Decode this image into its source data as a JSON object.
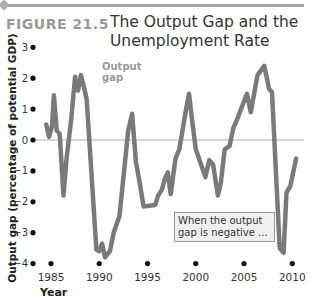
{
  "figure": {
    "number": "FIGURE 21.5",
    "title": "The Output Gap and the Unemployment Rate"
  },
  "colors": {
    "line": "#7a7a7a",
    "zero_line": "#c9c9c9",
    "figure_number": "#9a9a9a",
    "note_bg": "#f0f0f0"
  },
  "chart_data": {
    "type": "line",
    "title": "The Output Gap and the Unemployment Rate",
    "xlabel": "Year",
    "ylabel": "Output gap (percentage of potential GDP)",
    "xlim": [
      1984,
      2011
    ],
    "ylim": [
      -4,
      3
    ],
    "x_ticks": [
      1985,
      1990,
      1995,
      2000,
      2005,
      2010
    ],
    "y_ticks": [
      3,
      2,
      1,
      0,
      -1,
      -2,
      -3,
      -4
    ],
    "y_tick_labels": [
      "3",
      "2",
      "1",
      "0",
      "−1",
      "−2",
      "−3",
      "−4"
    ],
    "grid": false,
    "reference_line": 0,
    "series": [
      {
        "name": "Output gap",
        "x": [
          1984.5,
          1984.8,
          1985.1,
          1985.3,
          1985.6,
          1985.9,
          1986.3,
          1986.6,
          1987.1,
          1987.5,
          1987.8,
          1988.1,
          1988.5,
          1988.7,
          1989.7,
          1990.0,
          1990.3,
          1990.6,
          1991.1,
          1991.5,
          1992.1,
          1993.0,
          1993.4,
          1993.8,
          1994.2,
          1994.6,
          1995.8,
          1996.1,
          1996.5,
          1996.8,
          1997.1,
          1997.4,
          1997.9,
          1998.3,
          1999.0,
          1999.3,
          1999.6,
          2000.0,
          2001.0,
          2001.4,
          2001.8,
          2002.3,
          2002.6,
          2003.0,
          2003.5,
          2003.9,
          2004.2,
          2005.3,
          2005.7,
          2006.4,
          2007.1,
          2007.6,
          2007.9,
          2008.7,
          2009.1,
          2009.4,
          2009.8,
          2010.4
        ],
        "values": [
          0.5,
          0.1,
          0.45,
          1.45,
          0.3,
          0.2,
          -1.8,
          -0.65,
          0.7,
          2.05,
          1.6,
          2.1,
          1.6,
          1.3,
          -3.55,
          -3.6,
          -3.35,
          -3.8,
          -3.6,
          -3.0,
          -2.45,
          0.3,
          0.85,
          -0.7,
          -1.4,
          -2.15,
          -2.1,
          -1.8,
          -1.6,
          -1.25,
          -1.05,
          -1.75,
          -0.6,
          -0.3,
          1.0,
          1.5,
          0.7,
          -0.3,
          -1.2,
          -0.65,
          -0.8,
          -1.8,
          -1.4,
          -0.3,
          -0.2,
          0.4,
          0.6,
          1.5,
          0.9,
          2.1,
          2.4,
          1.65,
          1.55,
          -3.5,
          -3.65,
          -1.7,
          -1.5,
          -0.6
        ]
      }
    ],
    "annotations": [
      "Output gap",
      "When the output gap is negative ..."
    ]
  },
  "labels": {
    "series_label": "Output gap",
    "note": "When the output gap is negative ..."
  }
}
